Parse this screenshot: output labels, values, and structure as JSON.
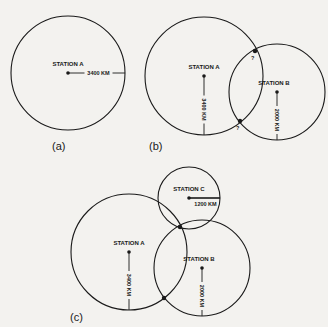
{
  "figure": {
    "panels": [
      {
        "id": "a",
        "label": "(a)",
        "stations": [
          {
            "name": "STATION A",
            "distance": "3400 KM",
            "cx": 68,
            "cy": 73,
            "r": 57,
            "radius_dir": "right"
          }
        ],
        "intersections": []
      },
      {
        "id": "b",
        "label": "(b)",
        "stations": [
          {
            "name": "STATION A",
            "distance": "3400 KM",
            "cx": 204,
            "cy": 76,
            "r": 59,
            "radius_dir": "down"
          },
          {
            "name": "STATION B",
            "distance": "2000 KM",
            "cx": 277,
            "cy": 92,
            "r": 48,
            "radius_dir": "down"
          }
        ],
        "intersections": [
          {
            "x": 255,
            "y": 51,
            "mark": "?"
          },
          {
            "x": 240,
            "y": 121,
            "mark": "?"
          }
        ]
      },
      {
        "id": "c",
        "label": "(c)",
        "stations": [
          {
            "name": "STATION A",
            "distance": "3400 KM",
            "cx": 129,
            "cy": 252,
            "r": 58,
            "radius_dir": "down"
          },
          {
            "name": "STATION B",
            "distance": "2000 KM",
            "cx": 202,
            "cy": 268,
            "r": 48,
            "radius_dir": "down"
          },
          {
            "name": "STATION C",
            "distance": "1200 KM",
            "cx": 189,
            "cy": 198,
            "r": 31,
            "radius_dir": "right"
          }
        ],
        "intersections": [
          {
            "x": 180,
            "y": 227,
            "mark": ""
          },
          {
            "x": 164,
            "y": 298,
            "mark": ""
          }
        ]
      }
    ],
    "colors": {
      "ink": "#1a1a1a",
      "paper": "#f3f2ef"
    }
  }
}
